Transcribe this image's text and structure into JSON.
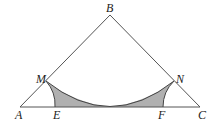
{
  "diagram": {
    "type": "geometry",
    "colors": {
      "line": "#555555",
      "shade": "#b0b0b0",
      "label": "#222222",
      "background": "#ffffff"
    },
    "points": {
      "A": {
        "label": "A",
        "x": 20,
        "y": 107
      },
      "B": {
        "label": "B",
        "x": 110,
        "y": 15
      },
      "C": {
        "label": "C",
        "x": 200,
        "y": 107
      },
      "M": {
        "label": "M",
        "x": 46,
        "y": 81
      },
      "N": {
        "label": "N",
        "x": 174,
        "y": 81
      },
      "E": {
        "label": "E",
        "x": 55,
        "y": 107
      },
      "F": {
        "label": "F",
        "x": 163,
        "y": 107
      }
    },
    "segments": [
      "AB",
      "BC",
      "AC"
    ],
    "arcs": [
      {
        "name": "arc-MN",
        "center": "B",
        "through": [
          "M",
          "N"
        ],
        "tangent_to": "AC"
      },
      {
        "name": "arc-ME",
        "center": "A",
        "through": [
          "M",
          "E"
        ]
      },
      {
        "name": "arc-NF",
        "center": "C",
        "through": [
          "N",
          "F"
        ]
      }
    ],
    "shaded_regions": [
      {
        "name": "left-shaded-region",
        "bounded_by": [
          "arc-ME",
          "segment-E-midpoint",
          "arc-MN"
        ]
      },
      {
        "name": "right-shaded-region",
        "bounded_by": [
          "arc-NF",
          "segment-F-midpoint",
          "arc-MN"
        ]
      }
    ]
  }
}
